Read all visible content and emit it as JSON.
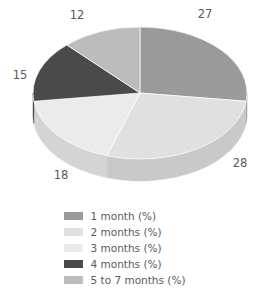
{
  "chart_data": {
    "type": "pie",
    "title": "",
    "subtitle": "",
    "xlabel": "",
    "ylabel": "",
    "three_d": true,
    "grid": false,
    "legend_position": "bottom",
    "start_angle_deg": 0,
    "direction": "clockwise",
    "total": 100,
    "categories": [
      "1 month (%)",
      "2 months (%)",
      "3 months (%)",
      "4 months (%)",
      "5 to 7 months (%)"
    ],
    "values": [
      27,
      28,
      18,
      15,
      12
    ],
    "value_labels": [
      "27",
      "28",
      "18",
      "15",
      "12"
    ],
    "colors": [
      "#9a9a9a",
      "#e0e0e0",
      "#ebebeb",
      "#4a4a4a",
      "#bcbcbc"
    ],
    "side_colors": [
      "#848486",
      "#c9c9c9",
      "#d4d4d4",
      "#3a3a3a",
      "#a6a6a8"
    ],
    "slices": [
      {
        "label": "1 month (%)",
        "value": 27,
        "value_label": "27",
        "color": "#9a9a9a",
        "side_color": "#848486",
        "label_x": 205,
        "label_y": 14
      },
      {
        "label": "2 months (%)",
        "value": 28,
        "value_label": "28",
        "color": "#e0e0e0",
        "side_color": "#c9c9c9",
        "label_x": 240,
        "label_y": 163
      },
      {
        "label": "3 months (%)",
        "value": 18,
        "value_label": "18",
        "color": "#ebebeb",
        "side_color": "#d4d4d4",
        "label_x": 61,
        "label_y": 175
      },
      {
        "label": "4 months (%)",
        "value": 15,
        "value_label": "15",
        "color": "#4a4a4a",
        "side_color": "#3a3a3a",
        "label_x": 20,
        "label_y": 75
      },
      {
        "label": "5 to 7 months (%)",
        "value": 12,
        "value_label": "12",
        "color": "#bcbcbc",
        "side_color": "#a6a6a8",
        "label_x": 77,
        "label_y": 15
      }
    ]
  },
  "legend": {
    "items": [
      {
        "label": "1 month (%)",
        "color": "#9a9a9a"
      },
      {
        "label": "2 months (%)",
        "color": "#e0e0e0"
      },
      {
        "label": "3 months (%)",
        "color": "#ebebeb"
      },
      {
        "label": "4 months (%)",
        "color": "#4a4a4a"
      },
      {
        "label": "5 to 7 months (%)",
        "color": "#bcbcbc"
      }
    ]
  },
  "geometry": {
    "cx": 140,
    "cy": 93,
    "rx": 107,
    "ry": 66,
    "depth": 22
  }
}
